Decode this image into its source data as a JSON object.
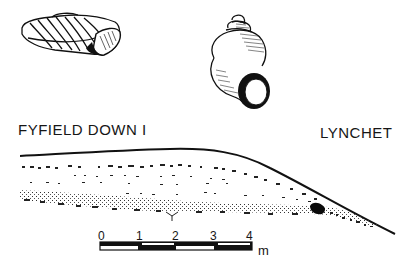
{
  "figure": {
    "site_label": "FYFIELD DOWN I",
    "feature_label": "LYNCHET",
    "illustrations": [
      {
        "name": "snail-shell-flat",
        "description": "low-spired land snail shell, side view"
      },
      {
        "name": "snail-shell-conical",
        "description": "conical land snail shell, apertural view"
      }
    ],
    "section": {
      "description": "lynchet section profile with stippled soil layers"
    },
    "scale_bar": {
      "ticks": [
        "0",
        "1",
        "2",
        "3",
        "4"
      ],
      "unit": "m"
    }
  }
}
